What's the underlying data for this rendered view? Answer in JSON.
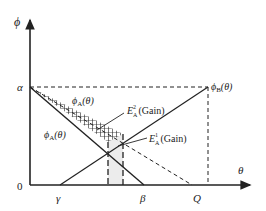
{
  "diagram": {
    "axes": {
      "y_label": "ϕ",
      "x_label": "θ",
      "origin_label": "0",
      "y_ticks": [
        {
          "label": "α"
        }
      ],
      "x_ticks": [
        {
          "label": "γ"
        },
        {
          "label": "β"
        },
        {
          "label": "Q"
        }
      ]
    },
    "curves": {
      "phi_B": {
        "label": "ϕ",
        "subscript": "B",
        "arg": "(θ)"
      },
      "phi_A_upper": {
        "label": "ϕ",
        "subscript": "A",
        "arg": "(θ)"
      },
      "phi_A_lower": {
        "label": "ϕ",
        "subscript": "A",
        "arg": "(θ)"
      }
    },
    "regions": {
      "E2": {
        "label": "E",
        "sup": "2",
        "sub": "A",
        "suffix": "(Gain)"
      },
      "E1": {
        "label": "E",
        "sup": "1",
        "sub": "A",
        "suffix": "(Gain)"
      }
    },
    "colors": {
      "line": "#222222",
      "shade": "#ececec",
      "background": "#ffffff"
    }
  }
}
